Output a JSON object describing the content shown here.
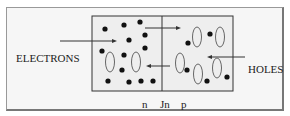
{
  "labels": {
    "electrons": "ELECTRONS",
    "holes": "HOLES",
    "n": "n",
    "junction": "Jn",
    "p": "p"
  },
  "colors": {
    "line": "#333333",
    "dot": "#111111",
    "hole": "#666666",
    "panel": "#eeeeee"
  }
}
